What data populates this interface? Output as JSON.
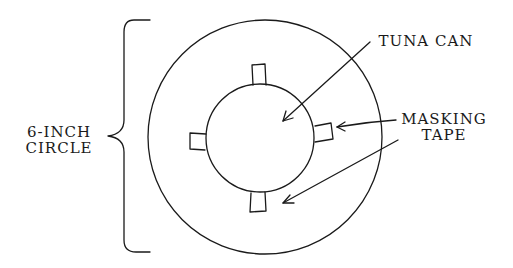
{
  "diagram": {
    "type": "hand-drawn sketch",
    "background": "#ffffff",
    "ink_color": "#1a1a1a",
    "brace_label": {
      "line1": "6-INCH",
      "line2": "CIRCLE"
    },
    "callouts": {
      "tuna_can": "TUNA CAN",
      "masking_tape_line1": "MASKING",
      "masking_tape_line2": "TAPE"
    },
    "shapes": {
      "outer_circle": {
        "cx": 265,
        "cy": 137,
        "r": 117
      },
      "inner_circle": {
        "cx": 260,
        "cy": 138,
        "r": 54
      },
      "tape_pieces": [
        "top",
        "right",
        "bottom",
        "left"
      ]
    }
  }
}
